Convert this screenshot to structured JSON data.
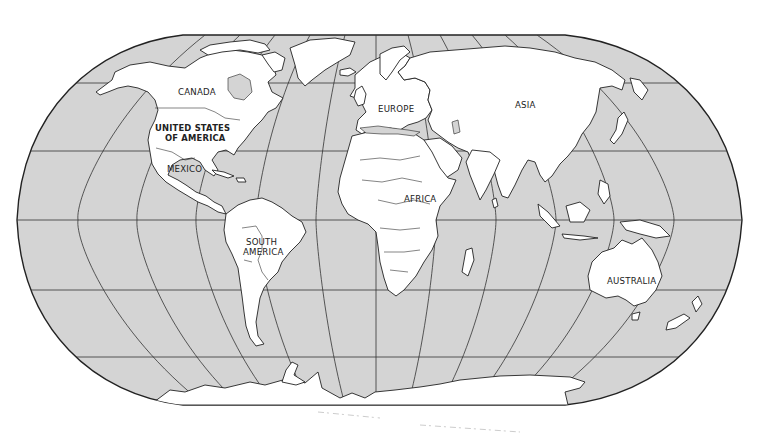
{
  "map": {
    "projection": "Robinson",
    "style": "outline",
    "colors": {
      "ocean": "#d4d4d4",
      "land": "#ffffff",
      "outline": "#222222",
      "background": "#ffffff"
    },
    "labels": {
      "canada": "CANADA",
      "usa_line1": "UNITED STATES",
      "usa_line2": "OF AMERICA",
      "mexico": "MEXICO",
      "south_america_line1": "SOUTH",
      "south_america_line2": "AMERICA",
      "europe": "EUROPE",
      "asia": "ASIA",
      "africa": "AFRICA",
      "australia": "AUSTRALIA"
    }
  }
}
